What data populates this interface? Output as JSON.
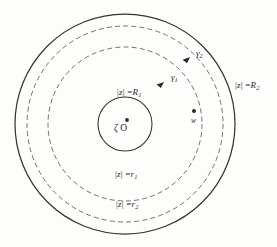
{
  "figure": {
    "kind": "concentric-circle-annulus-diagram",
    "background_color": "#fdfdfc",
    "ink_color": "#2b2b2b",
    "center": {
      "x": 125,
      "y": 124
    },
    "circles": [
      {
        "name": "outer-boundary-R2",
        "radius": 110,
        "style": "solid",
        "label_key": "label_R2"
      },
      {
        "name": "dashed-contour-r2",
        "radius": 98,
        "style": "dashed",
        "label_key": "label_r2"
      },
      {
        "name": "dashed-contour-r1",
        "radius": 77,
        "style": "dashed",
        "label_key": "label_r1"
      },
      {
        "name": "inner-boundary-R1",
        "radius": 27,
        "style": "solid",
        "label_key": "label_R1"
      }
    ],
    "labels": {
      "label_R1": {
        "text": "|z| = R₁",
        "prefix": "|",
        "var": "z",
        "suffix": "| =",
        "radius_symbol": "R",
        "radius_sub": "1",
        "x": 117,
        "y": 88
      },
      "label_R2": {
        "text": "|z| = R₂",
        "prefix": "|",
        "var": "z",
        "suffix": "| =",
        "radius_symbol": "R",
        "radius_sub": "2",
        "x": 235,
        "y": 81
      },
      "label_r1": {
        "text": "|z| = r₁",
        "prefix": "|",
        "var": "z",
        "suffix": "| =",
        "radius_symbol": "r",
        "radius_sub": "1",
        "x": 115,
        "y": 170
      },
      "label_r2": {
        "text": "|z| = r₂",
        "prefix": "|",
        "var": "z",
        "suffix": "| =",
        "radius_symbol": "r",
        "radius_sub": "2",
        "x": 116,
        "y": 200
      }
    },
    "contour_arrows": [
      {
        "name": "gamma-1",
        "symbol": "γ",
        "sub": "1",
        "label_x": 171,
        "label_y": 73,
        "arrow_x": 164,
        "arrow_y": 82,
        "angle_deg": 38,
        "on_circle": "dashed-contour-r1"
      },
      {
        "name": "gamma-2",
        "symbol": "γ",
        "sub": "2",
        "label_x": 196,
        "label_y": 49,
        "arrow_x": 190,
        "arrow_y": 57,
        "angle_deg": 40,
        "on_circle": "dashed-contour-r2"
      }
    ],
    "points": [
      {
        "name": "origin-point",
        "symbol": "ζ",
        "relation": "=",
        "value": "O",
        "dot_x": 127,
        "dot_y": 120,
        "label_x": 114,
        "label_y": 124
      },
      {
        "name": "point-w",
        "symbol": "w",
        "dot_x": 194,
        "dot_y": 111,
        "label_x": 191,
        "label_y": 117
      }
    ]
  }
}
